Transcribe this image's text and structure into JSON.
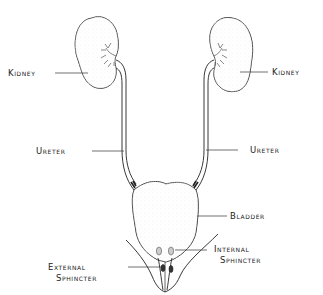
{
  "diagram": {
    "title": "",
    "labels": {
      "kidney_left": "Kidney",
      "kidney_right": "Kidney",
      "ureter_left": "Ureter",
      "ureter_right": "Ureter",
      "bladder": "Bladder",
      "internal_sphincter_1": "Internal",
      "internal_sphincter_2": "Sphincter",
      "external_sphincter_1": "External",
      "external_sphincter_2": "Sphincter"
    },
    "colors": {
      "line": "#222222",
      "stipple": "#b8b8b8",
      "background": "#ffffff"
    }
  }
}
